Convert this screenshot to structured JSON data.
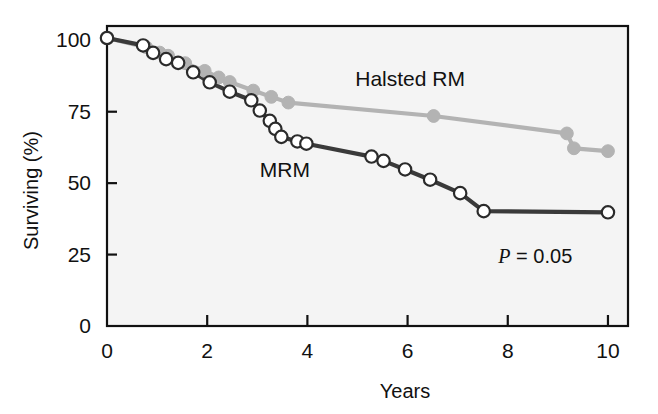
{
  "chart_data": {
    "type": "line",
    "title": "",
    "xlabel": "Years",
    "ylabel": "Surviving (%)",
    "xlim": [
      0,
      10.4
    ],
    "ylim": [
      0,
      105
    ],
    "xticks": [
      0,
      2,
      4,
      6,
      8,
      10
    ],
    "xtick_labels": [
      "0",
      "2",
      "4",
      "6",
      "8",
      "10"
    ],
    "yticks": [
      0,
      25,
      50,
      75,
      100
    ],
    "ytick_labels": [
      "0",
      "25",
      "50",
      "75",
      "100"
    ],
    "grid": false,
    "legend_position": "inline-annotation",
    "annotations": [
      {
        "name": "p-value",
        "italic_part": "P",
        "rest": " = 0.05",
        "text": "P = 0.05",
        "x": 8.55,
        "y": 22
      }
    ],
    "series": [
      {
        "name": "Halsted RM",
        "label": "Halsted RM",
        "color": "#b3b3b3",
        "marker": "filled-circle",
        "label_x": 6.05,
        "label_y": 84,
        "points": [
          {
            "x": 0.0,
            "y": 100.8
          },
          {
            "x": 0.78,
            "y": 97.6
          },
          {
            "x": 1.05,
            "y": 95.7
          },
          {
            "x": 1.22,
            "y": 94.6
          },
          {
            "x": 1.56,
            "y": 92.0
          },
          {
            "x": 1.95,
            "y": 89.3
          },
          {
            "x": 2.23,
            "y": 87.0
          },
          {
            "x": 2.45,
            "y": 85.4
          },
          {
            "x": 2.92,
            "y": 82.4
          },
          {
            "x": 3.28,
            "y": 80.2
          },
          {
            "x": 3.62,
            "y": 78.2
          },
          {
            "x": 6.52,
            "y": 73.5
          },
          {
            "x": 9.18,
            "y": 67.4
          },
          {
            "x": 9.32,
            "y": 62.2
          },
          {
            "x": 10.0,
            "y": 61.2
          }
        ]
      },
      {
        "name": "MRM",
        "label": "MRM",
        "color": "#3a3a3a",
        "marker": "open-circle",
        "label_x": 3.55,
        "label_y": 52,
        "points": [
          {
            "x": 0.0,
            "y": 100.8
          },
          {
            "x": 0.72,
            "y": 98.2
          },
          {
            "x": 0.92,
            "y": 95.6
          },
          {
            "x": 1.18,
            "y": 93.4
          },
          {
            "x": 1.42,
            "y": 92.1
          },
          {
            "x": 1.72,
            "y": 88.8
          },
          {
            "x": 2.05,
            "y": 85.3
          },
          {
            "x": 2.45,
            "y": 82.0
          },
          {
            "x": 2.88,
            "y": 79.0
          },
          {
            "x": 3.05,
            "y": 75.4
          },
          {
            "x": 3.25,
            "y": 71.8
          },
          {
            "x": 3.36,
            "y": 69.0
          },
          {
            "x": 3.48,
            "y": 66.2
          },
          {
            "x": 3.8,
            "y": 64.6
          },
          {
            "x": 3.98,
            "y": 63.8
          },
          {
            "x": 5.28,
            "y": 59.3
          },
          {
            "x": 5.52,
            "y": 57.8
          },
          {
            "x": 5.95,
            "y": 54.8
          },
          {
            "x": 6.45,
            "y": 51.2
          },
          {
            "x": 7.05,
            "y": 46.5
          },
          {
            "x": 7.52,
            "y": 40.2
          },
          {
            "x": 10.0,
            "y": 39.8
          }
        ]
      }
    ]
  },
  "axes": {
    "x_axis_label": "Years",
    "y_axis_label": "Surviving (%)"
  }
}
